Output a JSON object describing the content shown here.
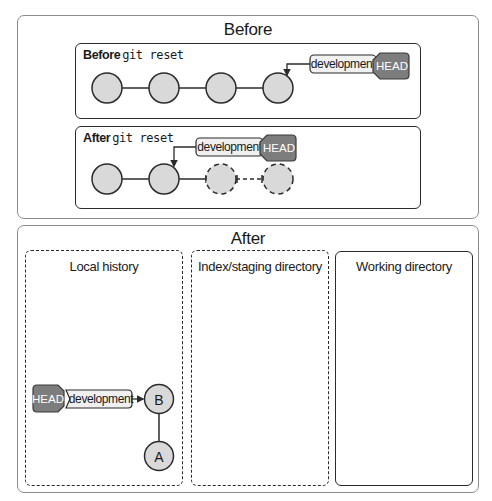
{
  "before_panel": {
    "title": "Before",
    "before_reset": {
      "caption_bold": "Before",
      "caption_code": "git reset",
      "commits": [
        {
          "x": 107,
          "style": "solid"
        },
        {
          "x": 164,
          "style": "solid"
        },
        {
          "x": 221,
          "style": "solid"
        },
        {
          "x": 278,
          "style": "solid"
        }
      ],
      "branch_label": "development",
      "head_label": "HEAD",
      "branch_points_to_commit": 4
    },
    "after_reset": {
      "caption_bold": "After",
      "caption_code": "git reset",
      "commits": [
        {
          "x": 107,
          "style": "solid"
        },
        {
          "x": 164,
          "style": "solid"
        },
        {
          "x": 221,
          "style": "dashed"
        },
        {
          "x": 278,
          "style": "dashed"
        }
      ],
      "branch_label": "development",
      "head_label": "HEAD",
      "branch_points_to_commit": 2
    }
  },
  "after_panel": {
    "title": "After",
    "columns": [
      {
        "title": "Local history",
        "border": "dashed"
      },
      {
        "title": "Index/staging directory",
        "border": "dashed"
      },
      {
        "title": "Working directory",
        "border": "solid"
      }
    ],
    "local_history": {
      "head_label": "HEAD",
      "branch_label": "development",
      "commits": [
        {
          "label": "B"
        },
        {
          "label": "A"
        }
      ]
    }
  },
  "colors": {
    "commit_fill": "#d9d9d9",
    "head_fill": "#7d7d7d",
    "branch_fill": "#f0f0f0",
    "stroke": "#2b2b2b"
  }
}
